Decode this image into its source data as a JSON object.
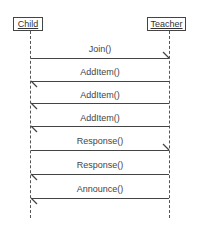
{
  "diagram": {
    "type": "sequence",
    "actors": [
      {
        "name": "Child"
      },
      {
        "name": "Teacher"
      }
    ],
    "messages": [
      {
        "label": "Join()",
        "from": "Child",
        "to": "Teacher"
      },
      {
        "label": "AddItem()",
        "from": "Teacher",
        "to": "Child"
      },
      {
        "label": "AddItem()",
        "from": "Teacher",
        "to": "Child"
      },
      {
        "label": "AddItem()",
        "from": "Teacher",
        "to": "Child"
      },
      {
        "label": "Response()",
        "from": "Child",
        "to": "Teacher"
      },
      {
        "label": "Response()",
        "from": "Teacher",
        "to": "Child"
      },
      {
        "label": "Announce()",
        "from": "Teacher",
        "to": "Child"
      }
    ]
  }
}
